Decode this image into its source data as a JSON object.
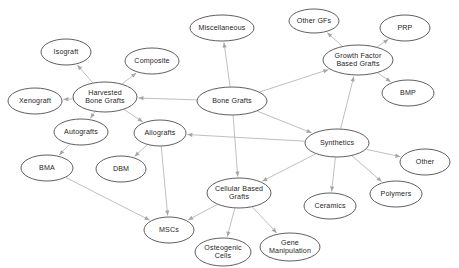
{
  "diagram": {
    "type": "node-link-diagram",
    "background_color": "#ffffff",
    "node_fill_color": "#ffffff",
    "node_stroke_color": "#4d4d4d",
    "edge_color": "#b3b3b3",
    "label_color": "#262626",
    "nodes": [
      {
        "id": "bone_grafts",
        "label": "Bone Grafts",
        "lines": [
          "Bone Grafts"
        ],
        "cx": 232,
        "cy": 101,
        "rx": 35,
        "ry": 14
      },
      {
        "id": "miscellaneous",
        "label": "Miscellaneous",
        "lines": [
          "Miscellaneous"
        ],
        "cx": 222,
        "cy": 28,
        "rx": 32,
        "ry": 13
      },
      {
        "id": "harvested",
        "label": "Harvested Bone Grafts",
        "lines": [
          "Harvested",
          "Bone Grafts"
        ],
        "cx": 105,
        "cy": 97,
        "rx": 32,
        "ry": 15
      },
      {
        "id": "isograft",
        "label": "Isograft",
        "lines": [
          "Isograft"
        ],
        "cx": 66,
        "cy": 52,
        "rx": 25,
        "ry": 13
      },
      {
        "id": "composite",
        "label": "Composite",
        "lines": [
          "Composite"
        ],
        "cx": 152,
        "cy": 61,
        "rx": 27,
        "ry": 13
      },
      {
        "id": "xenograft",
        "label": "Xenograft",
        "lines": [
          "Xenograft"
        ],
        "cx": 35,
        "cy": 101,
        "rx": 27,
        "ry": 13
      },
      {
        "id": "autografts",
        "label": "Autografts",
        "lines": [
          "Autografts"
        ],
        "cx": 81,
        "cy": 132,
        "rx": 27,
        "ry": 13
      },
      {
        "id": "allografts",
        "label": "Allografts",
        "lines": [
          "Allografts"
        ],
        "cx": 160,
        "cy": 133,
        "rx": 26,
        "ry": 13
      },
      {
        "id": "bma",
        "label": "BMA",
        "lines": [
          "BMA"
        ],
        "cx": 47,
        "cy": 168,
        "rx": 26,
        "ry": 13
      },
      {
        "id": "dbm",
        "label": "DBM",
        "lines": [
          "DBM"
        ],
        "cx": 121,
        "cy": 169,
        "rx": 25,
        "ry": 13
      },
      {
        "id": "mscs",
        "label": "MSCs",
        "lines": [
          "MSCs"
        ],
        "cx": 169,
        "cy": 230,
        "rx": 25,
        "ry": 13
      },
      {
        "id": "cellular",
        "label": "Cellular Based Grafts",
        "lines": [
          "Cellular Based",
          "Grafts"
        ],
        "cx": 239,
        "cy": 193,
        "rx": 32,
        "ry": 15
      },
      {
        "id": "osteogenic",
        "label": "Osteogenic Cells",
        "lines": [
          "Osteogenic",
          "Cells"
        ],
        "cx": 223,
        "cy": 252,
        "rx": 28,
        "ry": 14
      },
      {
        "id": "gene",
        "label": "Gene Manipulation",
        "lines": [
          "Gene",
          "Manipulation"
        ],
        "cx": 290,
        "cy": 247,
        "rx": 30,
        "ry": 14
      },
      {
        "id": "synthetics",
        "label": "Synthetics",
        "lines": [
          "Synthetics"
        ],
        "cx": 337,
        "cy": 143,
        "rx": 32,
        "ry": 14
      },
      {
        "id": "ceramics",
        "label": "Ceramics",
        "lines": [
          "Ceramics"
        ],
        "cx": 330,
        "cy": 206,
        "rx": 26,
        "ry": 13
      },
      {
        "id": "polymers",
        "label": "Polymers",
        "lines": [
          "Polymers"
        ],
        "cx": 396,
        "cy": 194,
        "rx": 26,
        "ry": 13
      },
      {
        "id": "other",
        "label": "Other",
        "lines": [
          "Other"
        ],
        "cx": 425,
        "cy": 162,
        "rx": 25,
        "ry": 13
      },
      {
        "id": "growth_factor",
        "label": "Growth Factor Based Grafts",
        "lines": [
          "Growth Factor",
          "Based Grafts"
        ],
        "cx": 358,
        "cy": 60,
        "rx": 35,
        "ry": 15
      },
      {
        "id": "other_gfs",
        "label": "Other GFs",
        "lines": [
          "Other GFs"
        ],
        "cx": 314,
        "cy": 21,
        "rx": 25,
        "ry": 12
      },
      {
        "id": "prp",
        "label": "PRP",
        "lines": [
          "PRP"
        ],
        "cx": 405,
        "cy": 28,
        "rx": 25,
        "ry": 13
      },
      {
        "id": "bmp",
        "label": "BMP",
        "lines": [
          "BMP"
        ],
        "cx": 408,
        "cy": 93,
        "rx": 26,
        "ry": 13
      }
    ],
    "edges": [
      {
        "id": "e1",
        "from": "bone_grafts",
        "to": "miscellaneous"
      },
      {
        "id": "e2",
        "from": "bone_grafts",
        "to": "harvested"
      },
      {
        "id": "e3",
        "from": "bone_grafts",
        "to": "growth_factor"
      },
      {
        "id": "e4",
        "from": "bone_grafts",
        "to": "synthetics"
      },
      {
        "id": "e5",
        "from": "bone_grafts",
        "to": "cellular"
      },
      {
        "id": "e6",
        "from": "harvested",
        "to": "isograft"
      },
      {
        "id": "e7",
        "from": "harvested",
        "to": "composite"
      },
      {
        "id": "e8",
        "from": "harvested",
        "to": "xenograft"
      },
      {
        "id": "e9",
        "from": "harvested",
        "to": "autografts"
      },
      {
        "id": "e10",
        "from": "harvested",
        "to": "allografts"
      },
      {
        "id": "e11",
        "from": "autografts",
        "to": "bma"
      },
      {
        "id": "e12",
        "from": "allografts",
        "to": "dbm"
      },
      {
        "id": "e13",
        "from": "allografts",
        "to": "mscs"
      },
      {
        "id": "e14",
        "from": "bma",
        "to": "mscs"
      },
      {
        "id": "e15",
        "from": "cellular",
        "to": "mscs"
      },
      {
        "id": "e16",
        "from": "cellular",
        "to": "osteogenic"
      },
      {
        "id": "e17",
        "from": "cellular",
        "to": "gene"
      },
      {
        "id": "e18",
        "from": "synthetics",
        "to": "allografts"
      },
      {
        "id": "e19",
        "from": "synthetics",
        "to": "cellular"
      },
      {
        "id": "e20",
        "from": "synthetics",
        "to": "ceramics"
      },
      {
        "id": "e21",
        "from": "synthetics",
        "to": "polymers"
      },
      {
        "id": "e22",
        "from": "synthetics",
        "to": "other"
      },
      {
        "id": "e23",
        "from": "synthetics",
        "to": "growth_factor"
      },
      {
        "id": "e24",
        "from": "growth_factor",
        "to": "other_gfs"
      },
      {
        "id": "e25",
        "from": "growth_factor",
        "to": "prp"
      },
      {
        "id": "e26",
        "from": "growth_factor",
        "to": "bmp"
      }
    ]
  }
}
